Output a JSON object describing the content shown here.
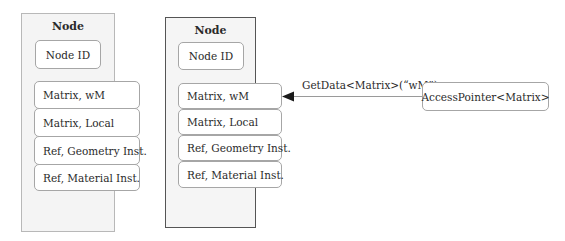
{
  "panels": [
    {
      "title": "Node",
      "id_label": "Node ID",
      "rows": [
        {
          "label": "Matrix, wM"
        },
        {
          "label": "Matrix, Local"
        },
        {
          "label": "Ref, Geometry Inst."
        },
        {
          "label": "Ref, Material Inst."
        }
      ]
    },
    {
      "title": "Node",
      "id_label": "Node ID",
      "rows": [
        {
          "label": "Matrix, wM"
        },
        {
          "label": "Matrix, Local"
        },
        {
          "label": "Ref, Geometry Inst."
        },
        {
          "label": "Ref, Material Inst."
        }
      ]
    }
  ],
  "connector": {
    "label": "GetData<Matrix>(“wM”)",
    "source": "AccessPointer<Matrix>",
    "target": "Matrix, wM"
  },
  "colors": {
    "panel_fill": "#f4f4f4",
    "panel_border_light": "#b8b8b8",
    "panel_border_dark": "#555555",
    "box_border": "#a6a6a6",
    "arrow": "#1a1a1a",
    "line": "#9a9a9a"
  }
}
